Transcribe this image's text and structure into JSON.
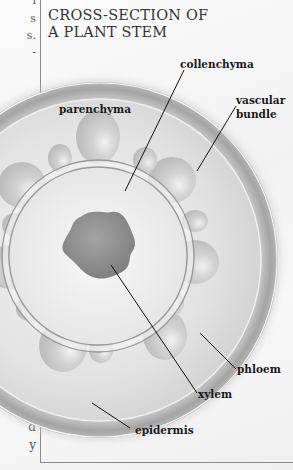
{
  "diagram": {
    "title": "CROSS-SECTION OF\nA PLANT STEM",
    "labels": {
      "collenchyma": "collenchyma",
      "vascular_bundle": "vascular\nbundle",
      "parenchyma": "parenchyma",
      "phloem": "phloem",
      "xylem": "xylem",
      "epidermis": "epidermis"
    },
    "left_column_fragments": [
      "s",
      "s.",
      "-",
      "d",
      "y"
    ],
    "colors": {
      "epidermis": "#a9a9a9",
      "cortex": "#dcdcdc",
      "pith_fill": "#ececec",
      "xylem_core": "#8e8e8e",
      "bundle": "#c4c4c4",
      "leader_lines": "#111111",
      "box_border": "#8a8a8a"
    }
  }
}
